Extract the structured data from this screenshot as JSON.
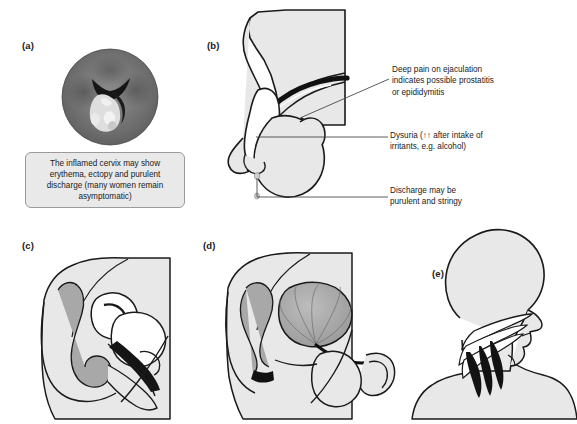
{
  "figure": {
    "width": 577,
    "height": 424,
    "background": "#ffffff",
    "panels": [
      {
        "id": "a",
        "label": "(a)",
        "subject": "inflamed-cervix-speculum-view",
        "label_x": 22,
        "label_y": 45
      },
      {
        "id": "b",
        "label": "(b)",
        "subject": "male-genitalia-sagittal-penis-scrotum",
        "label_x": 207,
        "label_y": 45
      },
      {
        "id": "c",
        "label": "(c)",
        "subject": "female-pelvis-sagittal-section",
        "label_x": 22,
        "label_y": 245
      },
      {
        "id": "d",
        "label": "(d)",
        "subject": "male-pelvis-sagittal-section-rectum",
        "label_x": 203,
        "label_y": 245
      },
      {
        "id": "e",
        "label": "(e)",
        "subject": "head-neck-profile-pharynx",
        "label_x": 432,
        "label_y": 272
      }
    ]
  },
  "caption": {
    "text": "The inflamed cervix may show erythema, ectopy and purulent discharge (many women remain asymptomatic)",
    "fill": "#e9e9e9",
    "border": "#9a9a9a"
  },
  "annotations": [
    {
      "id": "deep-pain-ejaculation",
      "text": "Deep pain on ejaculation\nindicates possible prostatitis\nor epididymitis"
    },
    {
      "id": "dysuria",
      "text": "Dysuria (↑↑ after intake of\nirritants, e.g. alcohol)"
    },
    {
      "id": "discharge",
      "text": "Discharge may be\npurulent and stringy"
    }
  ],
  "colors": {
    "skin_fill": "#e8e8e8",
    "organ_fill": "#a8a8a8",
    "outline": "#1a1a1a",
    "leader_line": "#5a5a5a",
    "text": "#1a1a1a",
    "cervix_dark": "#6d6d6d",
    "cervix_mid": "#7e7e7e",
    "cervix_discharge": "#e0e0e0"
  }
}
